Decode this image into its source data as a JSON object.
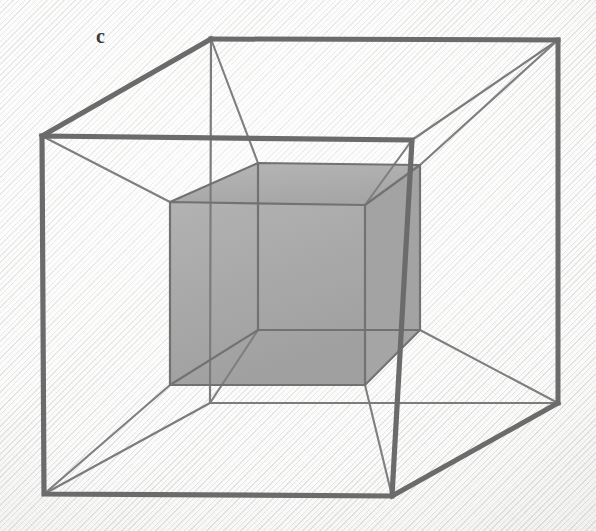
{
  "figure": {
    "label": "c",
    "caption_letter": "c",
    "type": "tesseract-projection",
    "background_color": "#eceeea",
    "stroke_color_outer": "#6e6e6e",
    "stroke_color_inner": "#6e6e6e",
    "stroke_color_connector": "#7c7c7c",
    "inner_cube_fill": "#a9a9a9",
    "inner_cube_side_fill": "#9e9e9e",
    "label_color": "#3b3b3b",
    "geometry": {
      "outer_front_face": [
        [
          42,
          136
        ],
        [
          412,
          140
        ],
        [
          392,
          496
        ],
        [
          44,
          494
        ]
      ],
      "outer_back_face": [
        [
          211,
          39
        ],
        [
          558,
          40
        ],
        [
          558,
          403
        ],
        [
          210,
          403
        ]
      ],
      "inner_front_face": [
        [
          170,
          202
        ],
        [
          365,
          205
        ],
        [
          365,
          385
        ],
        [
          170,
          385
        ]
      ],
      "inner_back_face": [
        [
          258,
          163
        ],
        [
          420,
          165
        ],
        [
          420,
          330
        ],
        [
          258,
          330
        ]
      ],
      "outer_connectors": [
        [
          [
            42,
            136
          ],
          [
            211,
            39
          ]
        ],
        [
          [
            412,
            140
          ],
          [
            558,
            40
          ]
        ],
        [
          [
            392,
            496
          ],
          [
            558,
            403
          ]
        ],
        [
          [
            44,
            494
          ],
          [
            210,
            403
          ]
        ]
      ],
      "inner_connectors": [
        [
          [
            170,
            202
          ],
          [
            258,
            163
          ]
        ],
        [
          [
            365,
            205
          ],
          [
            420,
            165
          ]
        ],
        [
          [
            365,
            385
          ],
          [
            420,
            330
          ]
        ],
        [
          [
            170,
            385
          ],
          [
            258,
            330
          ]
        ]
      ],
      "cell_connectors": [
        [
          [
            42,
            136
          ],
          [
            170,
            202
          ]
        ],
        [
          [
            412,
            140
          ],
          [
            365,
            205
          ]
        ],
        [
          [
            392,
            496
          ],
          [
            365,
            385
          ]
        ],
        [
          [
            44,
            494
          ],
          [
            170,
            385
          ]
        ],
        [
          [
            211,
            39
          ],
          [
            258,
            163
          ]
        ],
        [
          [
            558,
            40
          ],
          [
            420,
            165
          ]
        ],
        [
          [
            558,
            403
          ],
          [
            420,
            330
          ]
        ],
        [
          [
            210,
            403
          ],
          [
            258,
            330
          ]
        ]
      ]
    }
  }
}
